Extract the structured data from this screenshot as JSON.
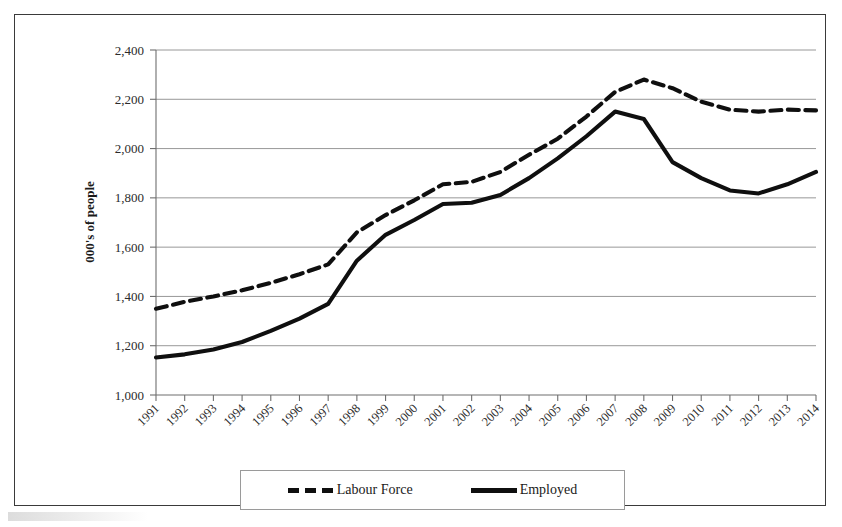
{
  "chart_data": {
    "type": "line",
    "title": "",
    "xlabel": "",
    "ylabel": "000's of people",
    "ylim": [
      1000,
      2400
    ],
    "ytick_step": 200,
    "grid": true,
    "legend_position": "bottom",
    "categories": [
      "1991",
      "1992",
      "1993",
      "1994",
      "1995",
      "1996",
      "1997",
      "1998",
      "1999",
      "2000",
      "2001",
      "2002",
      "2003",
      "2004",
      "2005",
      "2006",
      "2007",
      "2008",
      "2009",
      "2010",
      "2011",
      "2012",
      "2013",
      "2014"
    ],
    "ytick_labels": [
      "1,000",
      "1,200",
      "1,400",
      "1,600",
      "1,800",
      "2,000",
      "2,200",
      "2,400"
    ],
    "ytick_values": [
      1000,
      1200,
      1400,
      1600,
      1800,
      2000,
      2200,
      2400
    ],
    "series": [
      {
        "name": "Labour Force",
        "style": "dashed",
        "color": "#0f0f0f",
        "values": [
          1350,
          1378,
          1400,
          1425,
          1455,
          1490,
          1530,
          1660,
          1730,
          1790,
          1855,
          1865,
          1905,
          1975,
          2040,
          2130,
          2230,
          2280,
          2245,
          2190,
          2158,
          2150,
          2158,
          2155
        ]
      },
      {
        "name": "Employed",
        "style": "solid",
        "color": "#0f0f0f",
        "values": [
          1152,
          1165,
          1185,
          1215,
          1260,
          1310,
          1370,
          1545,
          1650,
          1710,
          1775,
          1780,
          1812,
          1880,
          1960,
          2050,
          2150,
          2120,
          1945,
          1880,
          1830,
          1818,
          1855,
          1905
        ]
      }
    ]
  },
  "legend": {
    "entries": [
      {
        "label": "Labour Force",
        "style": "dashed"
      },
      {
        "label": "Employed",
        "style": "solid"
      }
    ]
  }
}
